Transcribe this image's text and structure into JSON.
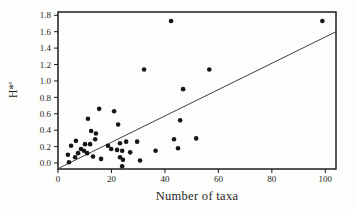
{
  "figure": {
    "background": "#fdfdfb",
    "ink": "#1c1c1c"
  },
  "chart_data": {
    "type": "scatter",
    "title": "",
    "xlabel": "Number of taxa",
    "ylabel": "H*'",
    "x_ticks": [
      0,
      20,
      40,
      60,
      80,
      100
    ],
    "y_ticks": [
      "0.0",
      "0.2",
      "0.4",
      "0.6",
      "0.8",
      "1.0",
      "1.2",
      "1.4",
      "1.6",
      "1.8"
    ],
    "xlim": [
      0,
      104
    ],
    "ylim": [
      -0.073,
      1.84
    ],
    "grid": false,
    "legend": null,
    "marker": {
      "shape": "circle",
      "radius": 2.3,
      "color": "#151515"
    },
    "axis_color": "#1c1c1c",
    "tick_length": 4,
    "trendline": {
      "x1": 0.5,
      "y1": -0.06,
      "x2": 104,
      "y2": 1.6,
      "color": "#2a2a2a"
    },
    "points": [
      [
        4.1,
        0.01
      ],
      [
        3.7,
        0.1
      ],
      [
        4.9,
        0.21
      ],
      [
        6.4,
        0.07
      ],
      [
        6.7,
        0.27
      ],
      [
        7.5,
        0.12
      ],
      [
        8.6,
        0.17
      ],
      [
        9.7,
        0.15
      ],
      [
        10.1,
        0.23
      ],
      [
        10.9,
        0.12
      ],
      [
        11.2,
        0.54
      ],
      [
        12.0,
        0.23
      ],
      [
        12.4,
        0.39
      ],
      [
        13.1,
        0.08
      ],
      [
        13.9,
        0.29
      ],
      [
        14.2,
        0.36
      ],
      [
        15.4,
        0.66
      ],
      [
        16.1,
        0.05
      ],
      [
        18.7,
        0.21
      ],
      [
        19.9,
        0.17
      ],
      [
        21.0,
        0.63
      ],
      [
        22.1,
        0.16
      ],
      [
        22.5,
        0.47
      ],
      [
        23.2,
        0.24
      ],
      [
        23.2,
        0.07
      ],
      [
        24.0,
        0.15
      ],
      [
        24.0,
        -0.04
      ],
      [
        24.3,
        0.04
      ],
      [
        25.5,
        0.26
      ],
      [
        27.0,
        0.13
      ],
      [
        29.6,
        0.26
      ],
      [
        30.7,
        0.03
      ],
      [
        32.2,
        1.14
      ],
      [
        36.5,
        0.15
      ],
      [
        42.3,
        1.73
      ],
      [
        43.4,
        0.29
      ],
      [
        44.9,
        0.18
      ],
      [
        45.7,
        0.52
      ],
      [
        46.8,
        0.9
      ],
      [
        51.7,
        0.3
      ],
      [
        56.6,
        1.14
      ],
      [
        98.9,
        1.73
      ]
    ],
    "plot_box": {
      "left": 58,
      "top": 12,
      "right": 336,
      "bottom": 169
    },
    "tick_font_size": 9
  }
}
